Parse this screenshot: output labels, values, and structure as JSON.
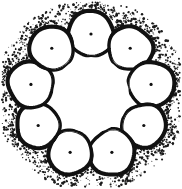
{
  "figure": {
    "title": "Ring assembly of nine circular subunits",
    "style": "ink line drawing with stipple shading",
    "background_color": "#ffffff",
    "ink_color": "#111111",
    "stipple_color": "#1a1a1a",
    "canvas": {
      "width": 182,
      "height": 189
    },
    "ring": {
      "center_x": 91,
      "center_y": 95,
      "radius": 61,
      "subunit_count": 9,
      "subunit_radius": 22,
      "outline_width": 2.6,
      "nucleus_dot_radius": 1.6,
      "start_angle_deg": -90
    },
    "subunits": [
      {
        "label": "subunit-1",
        "cx": 105,
        "cy": 36,
        "r": 23,
        "angle_deg": -66,
        "dot_cx": 105,
        "dot_cy": 37,
        "wobble": 0.9
      },
      {
        "label": "subunit-2",
        "cx": 143,
        "cy": 62,
        "r": 22,
        "angle_deg": -24,
        "dot_cx": 143,
        "dot_cy": 63,
        "wobble": 1.1
      },
      {
        "label": "subunit-3",
        "cx": 152,
        "cy": 107,
        "r": 23,
        "angle_deg": 16,
        "dot_cx": 151,
        "dot_cy": 107,
        "wobble": 0.8
      },
      {
        "label": "subunit-4",
        "cx": 128,
        "cy": 146,
        "r": 22,
        "angle_deg": 56,
        "dot_cx": 128,
        "dot_cy": 146,
        "wobble": 1.0
      },
      {
        "label": "subunit-5",
        "cx": 86,
        "cy": 159,
        "r": 23,
        "angle_deg": 96,
        "dot_cx": 86,
        "dot_cy": 160,
        "wobble": 1.2
      },
      {
        "label": "subunit-6",
        "cx": 45,
        "cy": 137,
        "r": 22,
        "angle_deg": 136,
        "dot_cx": 45,
        "dot_cy": 137,
        "wobble": 0.9
      },
      {
        "label": "subunit-7",
        "cx": 31,
        "cy": 92,
        "r": 22,
        "angle_deg": 176,
        "dot_cx": 31,
        "dot_cy": 92,
        "wobble": 1.0
      },
      {
        "label": "subunit-8",
        "cx": 57,
        "cy": 52,
        "r": 23,
        "angle_deg": 216,
        "dot_cx": 57,
        "dot_cy": 53,
        "wobble": 1.1
      },
      {
        "label": "subunit-9",
        "cx": 100,
        "cy": 36,
        "r": 22,
        "angle_deg": 256,
        "dot_cx": 100,
        "dot_cy": 36,
        "wobble": 0.8
      }
    ],
    "linkers": {
      "count": 9,
      "description": "short straight necks joining adjacent subunit outlines",
      "width": 2.4
    },
    "stipple": {
      "description": "ink speckle concentrated outside the ring in the gaps between subunits",
      "dot_count": 1200,
      "min_radius": 0.35,
      "max_radius": 1.35,
      "band_inner": 58,
      "band_outer": 96
    },
    "interior": {
      "description": "empty white lumen at the center of the ring",
      "fill": "#ffffff"
    }
  }
}
